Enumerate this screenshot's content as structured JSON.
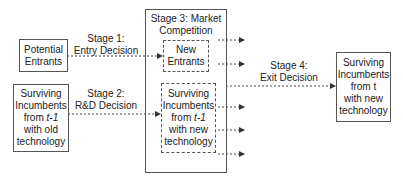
{
  "diagram": {
    "nodes": {
      "potential_entrants": {
        "line1": "Potential",
        "line2": "Entrants"
      },
      "old_incumbents": {
        "line1": "Surviving",
        "line2": "Incumbents",
        "line3a": "from ",
        "line3b": "t-1",
        "line4": "with old",
        "line5": "technology"
      },
      "stage3": {
        "line1": "Stage 3: Market",
        "line2": "Competition"
      },
      "new_entrants": {
        "line1": "New",
        "line2": "Entrants"
      },
      "new_incumbents": {
        "line1": "Surviving",
        "line2": "Incumbents",
        "line3a": "from ",
        "line3b": "t-1",
        "line4": "with new",
        "line5": "technology"
      },
      "final_incumbents": {
        "line1": "Surviving",
        "line2": "Incumbents",
        "line3": "from t",
        "line4": "with new",
        "line5": "technology"
      }
    },
    "edges": {
      "stage1": {
        "line1": "Stage 1:",
        "line2": "Entry Decision"
      },
      "stage2": {
        "line1": "Stage 2:",
        "line2": "R&D Decision"
      },
      "stage4": {
        "line1": "Stage 4:",
        "line2": "Exit Decision"
      }
    },
    "colors": {
      "line": "#555555",
      "text": "#222222",
      "background": "#ffffff"
    }
  }
}
